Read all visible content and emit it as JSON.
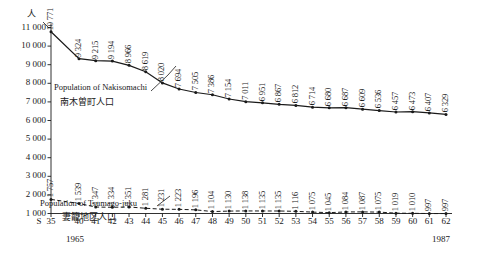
{
  "chart_data": {
    "type": "line",
    "title": "",
    "xlabel": "",
    "ylabel": "人",
    "unit_label": "人",
    "ylim": [
      1000,
      11000
    ],
    "ytick_step": 1000,
    "grid": false,
    "legend_position": "inline",
    "x_axis": {
      "era_prefix": "S",
      "tick_labels": [
        "35",
        "40",
        "41",
        "42",
        "43",
        "44",
        "45",
        "46",
        "47",
        "48",
        "49",
        "50",
        "51",
        "52",
        "53",
        "54",
        "55",
        "56",
        "57",
        "58",
        "59",
        "60",
        "61",
        "62"
      ],
      "start_year_note": "1965",
      "end_year_note": "1987"
    },
    "ytick_labels": [
      "11 000",
      "10 000",
      "9 000",
      "8 000",
      "7 000",
      "6 000",
      "5 000",
      "4 000",
      "3 000",
      "2 000",
      "1 000"
    ],
    "ytick_values": [
      11000,
      10000,
      9000,
      8000,
      7000,
      6000,
      5000,
      4000,
      3000,
      2000,
      1000
    ],
    "series": [
      {
        "name": "Population of Nakisomachi",
        "name_jp": "南木曽町人口",
        "style": "solid",
        "color": "#1a1a1a",
        "values": [
          10771,
          9324,
          9215,
          9194,
          8966,
          8619,
          8020,
          7694,
          7505,
          7386,
          7154,
          7011,
          6951,
          6867,
          6812,
          6714,
          6680,
          6687,
          6609,
          6536,
          6457,
          6473,
          6407,
          6329
        ],
        "labels": [
          "10 771",
          "9 324",
          "9 215",
          "9 194",
          "8 966",
          "8 619",
          "8 020",
          "7 694",
          "7 505",
          "7 386",
          "7 154",
          "7 011",
          "6 951",
          "6 867",
          "6 812",
          "6 714",
          "6 680",
          "6 687",
          "6 609",
          "6 536",
          "6 457",
          "6 473",
          "6 407",
          "6 329"
        ]
      },
      {
        "name": "Population of Tsumago-juku",
        "name_jp": "妻籠地区人口",
        "style": "dashed",
        "color": "#1a1a1a",
        "values": [
          1757,
          1539,
          1347,
          1334,
          1351,
          1281,
          1231,
          1223,
          1196,
          1104,
          1130,
          1138,
          1135,
          1135,
          1116,
          1075,
          1045,
          1084,
          1087,
          1075,
          1019,
          1010,
          997,
          997
        ],
        "labels": [
          "1 757",
          "1 539",
          "1 347",
          "1 334",
          "1 351",
          "1 281",
          "1 231",
          "1 223",
          "1 196",
          "1 104",
          "1 130",
          "1 138",
          "1 135",
          "1 135",
          "1 116",
          "1 075",
          "1 045",
          "1 084",
          "1 087",
          "1 075",
          "1 019",
          "1 010",
          "997",
          "997"
        ]
      }
    ]
  }
}
